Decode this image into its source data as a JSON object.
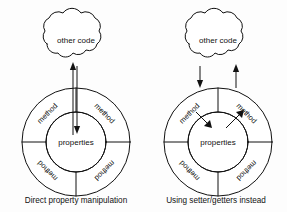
{
  "figure": {
    "background_color": "#fdfdfd",
    "stroke_color": "#111111",
    "text_color": "#111111"
  },
  "panels": [
    {
      "id": "left",
      "caption": "Direct property manipulation",
      "cloud_label": "other code",
      "center_label": "properties",
      "ring_labels": [
        "method",
        "method",
        "method",
        "method"
      ],
      "arrows": [
        {
          "name": "cloud-up-arrow",
          "direction": "up",
          "from": "properties",
          "to": "other code"
        },
        {
          "name": "properties-down-arrow",
          "direction": "down",
          "from": "other code",
          "to": "properties"
        }
      ]
    },
    {
      "id": "right",
      "caption": "Using setter/getters instead",
      "cloud_label": "other code",
      "center_label": "properties",
      "ring_labels": [
        "method",
        "method",
        "method",
        "method"
      ],
      "arrows": [
        {
          "name": "cloud-to-ring-arrow",
          "direction": "down",
          "from": "other code",
          "to": "method"
        },
        {
          "name": "ring-to-cloud-arrow",
          "direction": "up",
          "from": "method",
          "to": "other code"
        },
        {
          "name": "ring-to-properties-arrow",
          "direction": "inward",
          "from": "method",
          "to": "properties"
        },
        {
          "name": "properties-to-ring-arrow",
          "direction": "outward",
          "from": "properties",
          "to": "method"
        }
      ]
    }
  ]
}
